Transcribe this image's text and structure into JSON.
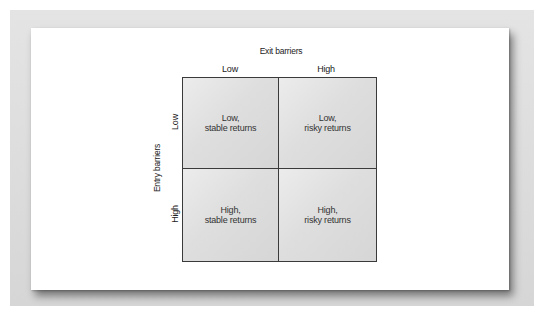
{
  "diagram": {
    "type": "2x2 matrix",
    "x_axis": {
      "title": "Exit barriers",
      "columns": [
        "Low",
        "High"
      ]
    },
    "y_axis": {
      "title": "Entry barriers",
      "rows": [
        "Low",
        "High"
      ]
    },
    "cells": [
      {
        "row": "Low",
        "col": "Low",
        "line1": "Low,",
        "line2": "stable returns"
      },
      {
        "row": "Low",
        "col": "High",
        "line1": "Low,",
        "line2": "risky returns"
      },
      {
        "row": "High",
        "col": "Low",
        "line1": "High,",
        "line2": "stable returns"
      },
      {
        "row": "High",
        "col": "High",
        "line1": "High,",
        "line2": "risky returns"
      }
    ]
  },
  "colors": {
    "frame": "#dcdcdc",
    "card": "#ffffff",
    "cell_fill": "#dedede",
    "grid_lines": "#3a3a3a",
    "text": "#333333"
  }
}
